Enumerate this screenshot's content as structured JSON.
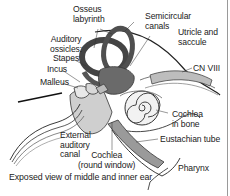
{
  "diagram": {
    "caption": "Exposed view of middle and inner ear",
    "labels": {
      "osseus_labyrinth": [
        "Osseus",
        "labyrinth"
      ],
      "auditory_ossicles": [
        "Auditory",
        "ossicles:",
        "Stapes"
      ],
      "incus": "Incus",
      "malleus": "Malleus",
      "semicircular_canals": [
        "Semicircular",
        "canals"
      ],
      "utricle_saccule": [
        "Utricle and",
        "saccule"
      ],
      "cn_viii": "CN VIII",
      "cochlea_bone": [
        "Cochlea",
        "in bone"
      ],
      "eustachian_tube": "Eustachian tube",
      "pharynx": "Pharynx",
      "external_canal": [
        "External",
        "auditory",
        "canal"
      ],
      "cochlea_round": [
        "Cochlea",
        "(round window)"
      ]
    },
    "colors": {
      "structure_dark": "#4a4a4a",
      "structure_mid": "#8c8c8c",
      "structure_light": "#c8c8c8",
      "line": "#222222",
      "background": "#ffffff"
    }
  }
}
